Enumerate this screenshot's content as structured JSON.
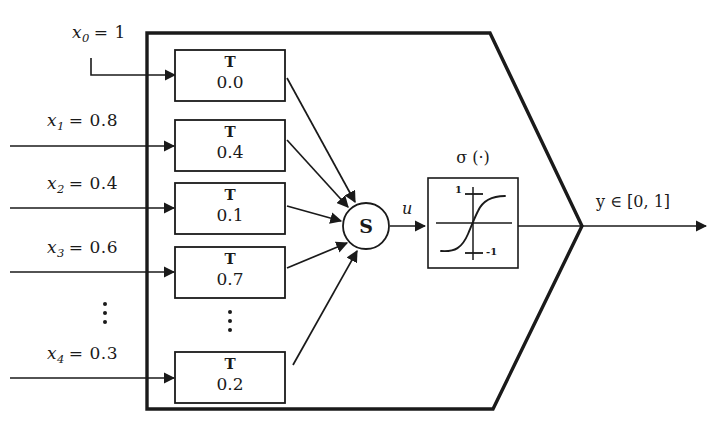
{
  "figure": {
    "background_color": "#ffffff",
    "ink_color": "#1a1a1a",
    "type": "block-diagram"
  },
  "inputs": [
    {
      "name": "x0",
      "label": "x",
      "subscript": "0",
      "equals": "= 1",
      "full": "x0 = 1",
      "row": 1
    },
    {
      "name": "x1",
      "label": "x",
      "subscript": "1",
      "equals": "= 0.8",
      "full": "x1 = 0.8",
      "row": 2
    },
    {
      "name": "x2",
      "label": "x",
      "subscript": "2",
      "equals": "= 0.4",
      "full": "x2 = 0.4",
      "row": 3
    },
    {
      "name": "x3",
      "label": "x",
      "subscript": "3",
      "equals": "= 0.6",
      "full": "x3 = 0.6",
      "row": 4
    },
    {
      "name": "x4",
      "label": "x",
      "subscript": "4",
      "equals": "= 0.3",
      "full": "x4 = 0.3",
      "row": 5
    }
  ],
  "tnorm_blocks": [
    {
      "title": "T",
      "value": "0.0"
    },
    {
      "title": "T",
      "value": "0.4"
    },
    {
      "title": "T",
      "value": "0.1"
    },
    {
      "title": "T",
      "value": "0.7"
    },
    {
      "title": "T",
      "value": "0.2"
    }
  ],
  "sum_node": {
    "glyph": "S",
    "name": "summation-node"
  },
  "intermediate": {
    "signal_label": "u"
  },
  "activation": {
    "title_sigma": "σ",
    "title_arg": "(·)",
    "title_full": "σ (·)",
    "tick_top": "1",
    "tick_bottom": "-1",
    "curve": "sigmoid"
  },
  "output": {
    "label": "y ∈ [0, 1]",
    "var": "y",
    "member": "∈",
    "range": "[0, 1]"
  },
  "ellipses": {
    "input_side": "vertical-dots",
    "block_side": "vertical-dots"
  }
}
